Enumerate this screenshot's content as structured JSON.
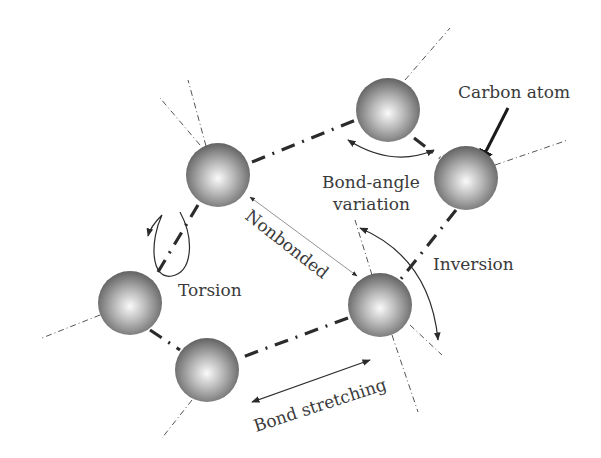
{
  "diagram": {
    "labels": {
      "carbon_atom": "Carbon atom",
      "bond_angle_line1": "Bond-angle",
      "bond_angle_line2": "variation",
      "nonbonded": "Nonbonded",
      "inversion": "Inversion",
      "torsion": "Torsion",
      "bond_stretching": "Bond stretching"
    },
    "atoms": [
      {
        "id": "a1",
        "x": 218,
        "y": 175
      },
      {
        "id": "a2",
        "x": 388,
        "y": 110
      },
      {
        "id": "a3",
        "x": 466,
        "y": 178
      },
      {
        "id": "a4",
        "x": 380,
        "y": 305
      },
      {
        "id": "a5",
        "x": 130,
        "y": 303
      },
      {
        "id": "a6",
        "x": 207,
        "y": 370
      }
    ],
    "colors": {
      "atom_light": "#f4f4f4",
      "atom_dark": "#6a6a6a",
      "line": "#2b2b2b",
      "text": "#3a3a3a"
    }
  }
}
